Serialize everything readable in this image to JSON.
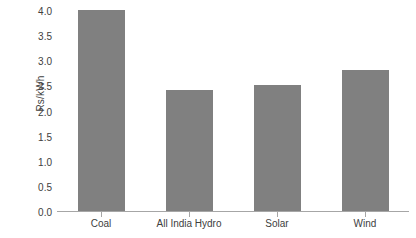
{
  "chart_data": {
    "type": "bar",
    "title": "",
    "subtitle": "",
    "xlabel": "",
    "ylabel": "Rs/kWh",
    "categories": [
      "Coal",
      "All India Hydro",
      "Solar",
      "Wind"
    ],
    "values": [
      4.0,
      2.4,
      2.5,
      2.8
    ],
    "series": [
      {
        "name": "Tariff",
        "values": [
          4.0,
          2.4,
          2.5,
          2.8
        ]
      }
    ],
    "ylim": [
      0.0,
      4.0
    ],
    "ytick_values": [
      0.0,
      0.5,
      1.0,
      1.5,
      2.0,
      2.5,
      3.0,
      3.5,
      4.0
    ],
    "ytick_labels": [
      "0.0",
      "0.5",
      "1.0",
      "1.5",
      "2.0",
      "2.5",
      "3.0",
      "3.5",
      "4.0"
    ],
    "grid": false,
    "legend": false,
    "legend_position": "none",
    "annotations": [],
    "bar_color": "#808080",
    "axis_color": "#a6a6a6",
    "text_color": "#404040",
    "background_color": "#ffffff"
  }
}
